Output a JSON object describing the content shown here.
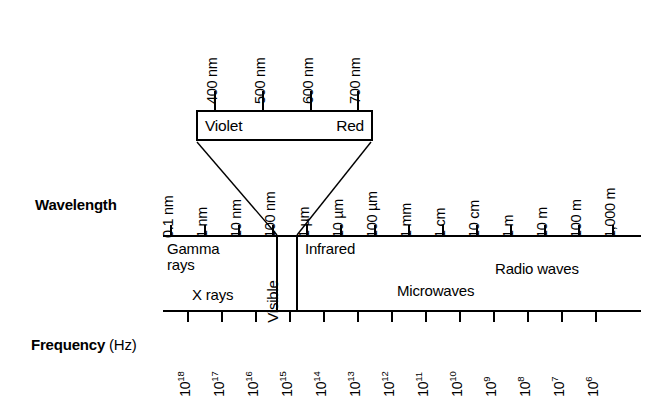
{
  "diagram": {
    "wavelength_axis": {
      "label": "Wavelength",
      "ticks": [
        "0.1 nm",
        "1 nm",
        "10 nm",
        "100 nm",
        "1 µm",
        "10 µm",
        "100 µm",
        "1 mm",
        "1 cm",
        "10 cm",
        "1 m",
        "10 m",
        "100 m",
        "1,000 m"
      ]
    },
    "frequency_axis": {
      "label": "Frequency",
      "unit": " (Hz)",
      "ticks": [
        {
          "mantissa": "10",
          "exponent": "18"
        },
        {
          "mantissa": "10",
          "exponent": "17"
        },
        {
          "mantissa": "10",
          "exponent": "16"
        },
        {
          "mantissa": "10",
          "exponent": "15"
        },
        {
          "mantissa": "10",
          "exponent": "14"
        },
        {
          "mantissa": "10",
          "exponent": "13"
        },
        {
          "mantissa": "10",
          "exponent": "12"
        },
        {
          "mantissa": "10",
          "exponent": "11"
        },
        {
          "mantissa": "10",
          "exponent": "10"
        },
        {
          "mantissa": "10",
          "exponent": "9"
        },
        {
          "mantissa": "10",
          "exponent": "8"
        },
        {
          "mantissa": "10",
          "exponent": "7"
        },
        {
          "mantissa": "10",
          "exponent": "6"
        }
      ]
    },
    "bands": [
      {
        "name": "gamma-rays",
        "line1": "Gamma",
        "line2": "rays"
      },
      {
        "name": "x-rays",
        "line1": "X rays",
        "line2": ""
      },
      {
        "name": "visible",
        "line1": "Visible",
        "line2": ""
      },
      {
        "name": "infrared",
        "line1": "Infrared",
        "line2": ""
      },
      {
        "name": "microwaves",
        "line1": "Microwaves",
        "line2": ""
      },
      {
        "name": "radio-waves",
        "line1": "Radio waves",
        "line2": ""
      }
    ],
    "visible_callout": {
      "left_color": "Violet",
      "right_color": "Red",
      "nm_ticks": [
        "400 nm",
        "500 nm",
        "600 nm",
        "700 nm"
      ]
    },
    "colors": {
      "ink": "#000000",
      "background": "#ffffff"
    }
  }
}
